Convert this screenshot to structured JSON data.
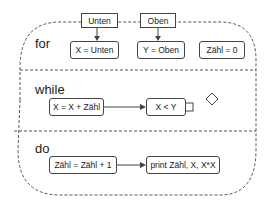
{
  "sections": {
    "for": {
      "label": "for",
      "inputs": [
        "Unten",
        "Oben"
      ],
      "boxes": [
        "X = Unten",
        "Y = Oben",
        "Zähl = 0"
      ]
    },
    "while": {
      "label": "while",
      "boxes": [
        "X = X + Zähl",
        "X < Y"
      ]
    },
    "do": {
      "label": "do",
      "boxes": [
        "Zähl = Zähl + 1",
        "print Zähl, X, X*X"
      ]
    }
  },
  "colors": {
    "stroke": "#444444",
    "dashed": "#555555",
    "background": "#ffffff"
  }
}
